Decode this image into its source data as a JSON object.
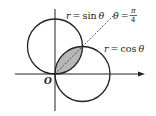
{
  "diagram": {
    "type": "polar-curves",
    "curves": [
      {
        "name": "sin-circle",
        "equation_label": "r = sin θ",
        "lhs": "r",
        "eq": "=",
        "fn": "sin",
        "var": "θ"
      },
      {
        "name": "cos-circle",
        "equation_label": "r = cos θ",
        "lhs": "r",
        "eq": "=",
        "fn": "cos",
        "var": "θ"
      }
    ],
    "ray": {
      "label": "θ = π/4",
      "lhs": "θ",
      "eq": "=",
      "numerator": "π",
      "denominator": "4",
      "style": "dashed"
    },
    "origin_label": "O",
    "shaded_region": "overlap of both circles",
    "colors": {
      "stroke": "#222222",
      "shade": "#b8b8b8",
      "background": "#ffffff"
    }
  }
}
